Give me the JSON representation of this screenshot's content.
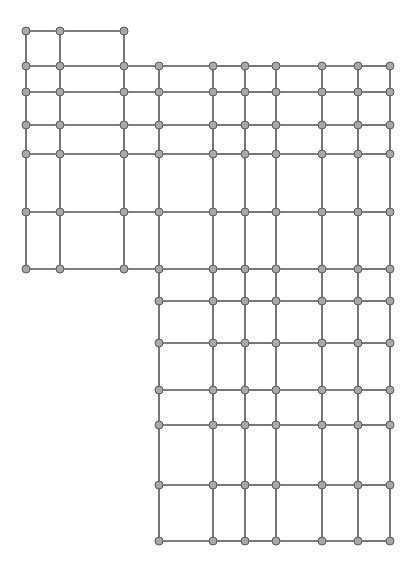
{
  "diagram": {
    "type": "grid-graph",
    "colors": {
      "edge": "#555555",
      "node_fill": "#a8a8a8",
      "node_stroke": "#5a5a5a",
      "background": "#ffffff"
    },
    "node_radius": 4,
    "regions": [
      {
        "name": "top-left-cap",
        "xs": [
          26,
          60,
          124
        ],
        "ys": [
          31,
          66
        ]
      },
      {
        "name": "left-block",
        "xs": [
          26,
          60,
          124,
          159
        ],
        "ys": [
          66,
          92,
          125,
          154,
          212,
          269
        ]
      },
      {
        "name": "right-upper-block",
        "xs": [
          159,
          213,
          245,
          276,
          322,
          358,
          390
        ],
        "ys": [
          66,
          92,
          125,
          154,
          212,
          269
        ]
      },
      {
        "name": "right-lower-block",
        "xs": [
          159,
          213,
          245,
          276,
          322,
          358,
          390
        ],
        "ys": [
          269,
          301,
          343,
          390,
          425,
          485,
          541
        ]
      }
    ]
  }
}
